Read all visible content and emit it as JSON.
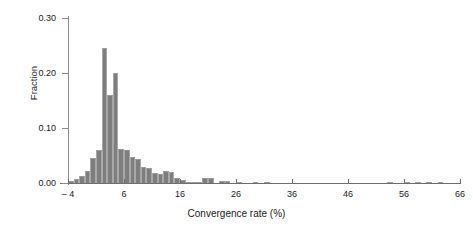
{
  "chart_data": {
    "type": "bar",
    "title": "",
    "xlabel": "Convergence rate (%)",
    "ylabel": "Fraction",
    "xlim": [
      -4,
      66
    ],
    "ylim": [
      0.0,
      0.3
    ],
    "grid": false,
    "legend": "none",
    "bin_width": 1,
    "bar_color": "#7e7e7e",
    "xticks": [
      -4,
      6,
      16,
      26,
      36,
      46,
      56,
      66
    ],
    "xtick_labels": [
      "– 4",
      "6",
      "16",
      "26",
      "36",
      "46",
      "56",
      "66"
    ],
    "yticks": [
      0.0,
      0.1,
      0.2,
      0.3
    ],
    "ytick_labels": [
      "0.00",
      "0.10",
      "0.20",
      "0.30"
    ],
    "bins": [
      {
        "x": -4,
        "value": 0.004
      },
      {
        "x": -3,
        "value": 0.008
      },
      {
        "x": -2,
        "value": 0.012
      },
      {
        "x": -1,
        "value": 0.022
      },
      {
        "x": 0,
        "value": 0.046
      },
      {
        "x": 1,
        "value": 0.06
      },
      {
        "x": 2,
        "value": 0.245
      },
      {
        "x": 3,
        "value": 0.16
      },
      {
        "x": 4,
        "value": 0.2
      },
      {
        "x": 5,
        "value": 0.062
      },
      {
        "x": 6,
        "value": 0.06
      },
      {
        "x": 7,
        "value": 0.047
      },
      {
        "x": 8,
        "value": 0.044
      },
      {
        "x": 9,
        "value": 0.03
      },
      {
        "x": 10,
        "value": 0.028
      },
      {
        "x": 11,
        "value": 0.018
      },
      {
        "x": 12,
        "value": 0.016
      },
      {
        "x": 13,
        "value": 0.022
      },
      {
        "x": 14,
        "value": 0.02
      },
      {
        "x": 15,
        "value": 0.01
      },
      {
        "x": 16,
        "value": 0.006
      },
      {
        "x": 17,
        "value": 0.002
      },
      {
        "x": 18,
        "value": 0.002
      },
      {
        "x": 19,
        "value": 0.001
      },
      {
        "x": 20,
        "value": 0.01
      },
      {
        "x": 21,
        "value": 0.01
      },
      {
        "x": 23,
        "value": 0.004
      },
      {
        "x": 24,
        "value": 0.004
      },
      {
        "x": 26,
        "value": 0.002
      },
      {
        "x": 29,
        "value": 0.001
      },
      {
        "x": 31,
        "value": 0.001
      },
      {
        "x": 53,
        "value": 0.002
      },
      {
        "x": 56,
        "value": 0.001
      },
      {
        "x": 58,
        "value": 0.002
      },
      {
        "x": 60,
        "value": 0.002
      },
      {
        "x": 62,
        "value": 0.001
      }
    ]
  }
}
